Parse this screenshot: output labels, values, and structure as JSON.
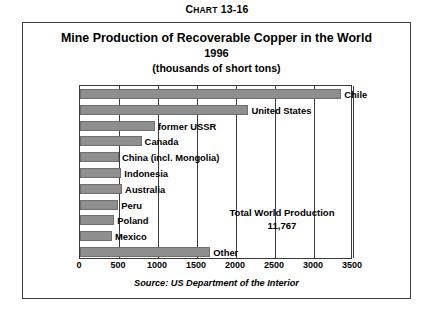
{
  "caption": {
    "prefix": "C",
    "word": "HART",
    "number": " 13-16"
  },
  "title": {
    "main": "Mine Production of Recoverable Copper in the World",
    "year": "1996",
    "units": "(thousands of short tons)"
  },
  "annotation": {
    "line1": "Total World Production",
    "line2": "11,767"
  },
  "source": "Source:  US Department of the Interior",
  "colors": {
    "bar_fill": "#8e8e8e",
    "bar_stroke": "#6f6f6f",
    "frame": "#3a3a3a",
    "text": "#000000",
    "background": "#ffffff"
  },
  "chart_data": {
    "type": "bar",
    "orientation": "horizontal",
    "title": "Mine Production of Recoverable Copper in the World 1996 (thousands of short tons)",
    "xlabel": "",
    "ylabel": "",
    "xlim": [
      0,
      3500
    ],
    "xticks": [
      0,
      500,
      1000,
      1500,
      2000,
      2500,
      3000,
      3500
    ],
    "xtick_labels": [
      "0",
      "500",
      "1000",
      "1500",
      "2000",
      "2500",
      "3000",
      "3500"
    ],
    "grid": true,
    "legend": "none",
    "categories": [
      "Chile",
      "United States",
      "former USSR",
      "Canada",
      "China (incl. Mongolia)",
      "Indonesia",
      "Australia",
      "Peru",
      "Poland",
      "Mexico",
      "Other"
    ],
    "values": [
      3350,
      2160,
      960,
      790,
      500,
      530,
      540,
      490,
      440,
      410,
      1670
    ],
    "total_world_production": 11767,
    "units": "thousands of short tons",
    "year": "1996",
    "source": "US Department of the Interior"
  }
}
